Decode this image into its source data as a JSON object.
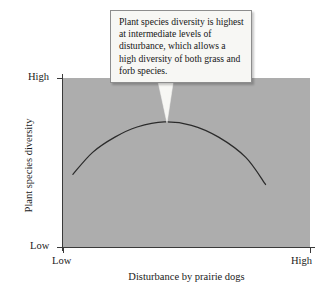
{
  "figure": {
    "background_color": "#ffffff",
    "plot_fill_color": "#adadad",
    "curve_color": "#2b2b2b",
    "axis_color": "#3a3a3a"
  },
  "callout": {
    "text": "Plant species diversity is highest at intermediate levels of disturbance, which allows a high diversity of both grass and forb species.",
    "background_color": "#f7f7f4",
    "border_color": "#8d8d8d"
  },
  "chart_data": {
    "type": "line",
    "title": "",
    "subtitle": "",
    "xlabel": "Disturbance by prairie dogs",
    "ylabel": "Plant species diversity",
    "x_tick_labels": [
      "Low",
      "High"
    ],
    "y_tick_labels": [
      "Low",
      "High"
    ],
    "xlim": [
      0,
      1
    ],
    "ylim": [
      0,
      1
    ],
    "grid": false,
    "legend": false,
    "annotations": [
      {
        "text": "Plant species diversity is highest at intermediate levels of disturbance, which allows a high diversity of both grass and forb species.",
        "points_to_x": 0.41,
        "points_to_y": 0.74
      }
    ],
    "series": [
      {
        "name": "Plant species diversity vs. disturbance",
        "x": [
          0.04,
          0.12,
          0.21,
          0.3,
          0.41,
          0.52,
          0.63,
          0.74,
          0.82
        ],
        "y": [
          0.43,
          0.56,
          0.65,
          0.71,
          0.74,
          0.72,
          0.65,
          0.53,
          0.37
        ]
      }
    ]
  }
}
